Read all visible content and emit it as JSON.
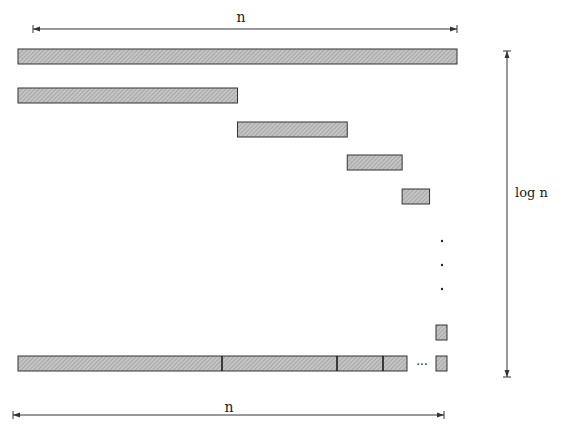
{
  "diagram": {
    "top_dimension_label": "n",
    "bottom_dimension_label": "n",
    "side_dimension_label": "log n",
    "ellipsis_label": "···",
    "vertical_ellipsis": [
      "·",
      "·",
      "·"
    ],
    "fill_color": "#bdbdbd",
    "stroke_color": "#333333",
    "levels": [
      {
        "name": "level-1",
        "fraction_start": 0.0,
        "fraction_width": 1.0
      },
      {
        "name": "level-2",
        "fraction_start": 0.0,
        "fraction_width": 0.5
      },
      {
        "name": "level-3",
        "fraction_start": 0.5,
        "fraction_width": 0.25
      },
      {
        "name": "level-4",
        "fraction_start": 0.75,
        "fraction_width": 0.125
      },
      {
        "name": "level-5",
        "fraction_start": 0.875,
        "fraction_width": 0.0625
      },
      {
        "name": "level-last",
        "fraction_start": 0.95,
        "fraction_width": 0.025
      }
    ],
    "combined_row": {
      "segments_fraction_end": [
        0.5,
        0.75,
        0.875,
        0.9375
      ],
      "final_block_fraction": 0.025
    }
  }
}
